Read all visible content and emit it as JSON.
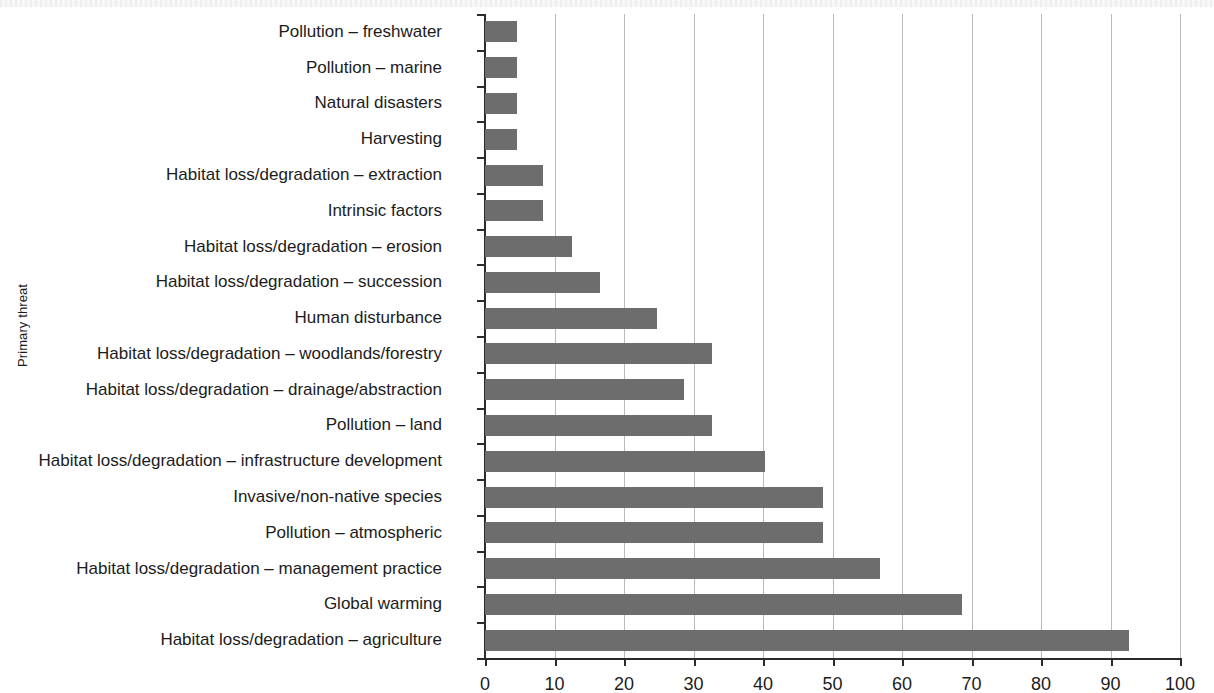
{
  "chart_data": {
    "type": "bar",
    "orientation": "horizontal",
    "title": "",
    "xlabel": "",
    "ylabel": "Primary threat",
    "xlim": [
      0,
      100
    ],
    "ylim": null,
    "grid": "vertical",
    "legend": null,
    "bar_color": "#6d6d6d",
    "axis_color": "#2b2b2b",
    "gridline_color": "#b9b9b9",
    "xticks": [
      0,
      10,
      20,
      30,
      40,
      50,
      60,
      70,
      80,
      90,
      100
    ],
    "xtick_labels": [
      "0",
      "10",
      "20",
      "30",
      "40",
      "50",
      "60",
      "70",
      "80",
      "90",
      "100"
    ],
    "categories": [
      "Pollution – freshwater",
      "Pollution – marine",
      "Natural disasters",
      "Harvesting",
      "Habitat loss/degradation – extraction",
      "Intrinsic factors",
      "Habitat loss/degradation – erosion",
      "Habitat loss/degradation – succession",
      "Human disturbance",
      "Habitat loss/degradation – woodlands/forestry",
      "Habitat loss/degradation – drainage/abstraction",
      "Pollution – land",
      "Habitat loss/degradation – infrastructure development",
      "Invasive/non-native species",
      "Pollution – atmospheric",
      "Habitat loss/degradation – management practice",
      "Global warming",
      "Habitat loss/degradation – agriculture"
    ],
    "values": [
      4.6,
      4.6,
      4.6,
      4.6,
      8.3,
      8.3,
      12.5,
      16.5,
      24.7,
      32.7,
      28.6,
      32.7,
      40.3,
      48.6,
      48.6,
      56.8,
      68.6,
      92.7
    ]
  }
}
